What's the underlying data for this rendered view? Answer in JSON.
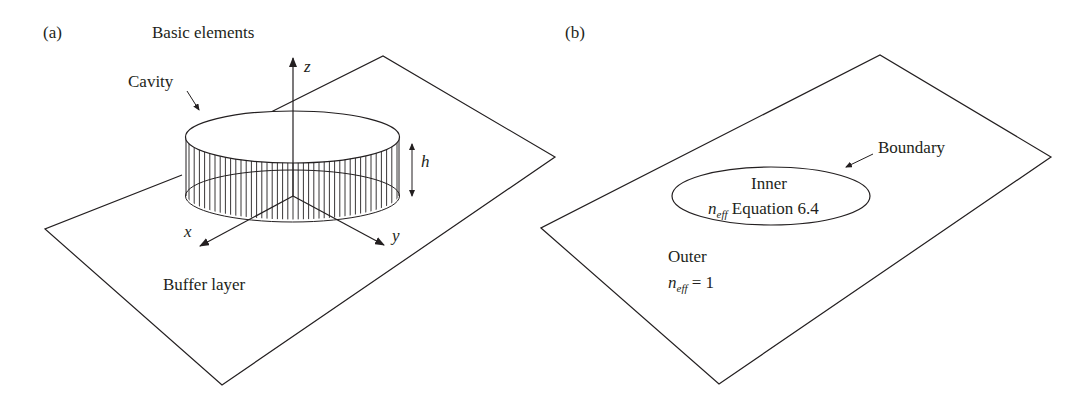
{
  "panel_a": {
    "label": "(a)",
    "title": "Basic elements",
    "cavity_label": "Cavity",
    "axis_z": "z",
    "axis_x": "x",
    "axis_y": "y",
    "height_label": "h",
    "buffer_label": "Buffer layer"
  },
  "panel_b": {
    "label": "(b)",
    "boundary_label": "Boundary",
    "inner_label": "Inner",
    "inner_n": "n",
    "inner_sub": "eff",
    "inner_eq": " Equation 6.4",
    "outer_label": "Outer",
    "outer_n": "n",
    "outer_sub": "eff",
    "outer_eq": " = 1"
  },
  "colors": {
    "stroke": "#231f20",
    "background": "#ffffff"
  }
}
